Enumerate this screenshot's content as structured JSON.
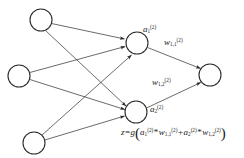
{
  "figure": {
    "type": "neural-network-diagram",
    "title": "",
    "background_color": "#ffffff",
    "stroke_color": "#2b2b2b",
    "text_color": "#1a1a1a"
  },
  "layers": [
    {
      "name": "input-layer",
      "nodes": [
        {
          "id": "input-1",
          "label": "",
          "cx": 41,
          "cy": 20,
          "r": 11
        },
        {
          "id": "input-2",
          "label": "",
          "cx": 19,
          "cy": 76,
          "r": 11
        },
        {
          "id": "input-3",
          "label": "",
          "cx": 34,
          "cy": 143,
          "r": 11
        }
      ]
    },
    {
      "name": "hidden-layer",
      "nodes": [
        {
          "id": "hidden-1",
          "label": "a",
          "sub": "1",
          "sup": "(2)",
          "cx": 137,
          "cy": 43,
          "r": 11
        },
        {
          "id": "hidden-2",
          "label": "a",
          "sub": "2",
          "sup": "(2)",
          "cx": 136,
          "cy": 112,
          "r": 11
        }
      ]
    },
    {
      "name": "output-layer",
      "nodes": [
        {
          "id": "output-1",
          "label": "",
          "cx": 210,
          "cy": 75,
          "r": 11
        }
      ]
    }
  ],
  "node_labels": {
    "a1": {
      "base": "a",
      "sub": "1",
      "sup": "(2)"
    },
    "a2": {
      "base": "a",
      "sub": "2",
      "sup": "(2)"
    }
  },
  "edge_labels": {
    "w11": {
      "base": "w",
      "sub": "1,1",
      "sup": "(2)"
    },
    "w12": {
      "base": "w",
      "sub": "1,2",
      "sup": "(2)"
    }
  },
  "edges": [
    {
      "from": "input-1",
      "to": "hidden-1",
      "label": ""
    },
    {
      "from": "input-1",
      "to": "hidden-2",
      "label": ""
    },
    {
      "from": "input-2",
      "to": "hidden-1",
      "label": ""
    },
    {
      "from": "input-2",
      "to": "hidden-2",
      "label": ""
    },
    {
      "from": "input-3",
      "to": "hidden-1",
      "label": ""
    },
    {
      "from": "input-3",
      "to": "hidden-2",
      "label": ""
    },
    {
      "from": "hidden-1",
      "to": "output-1",
      "label": "w_1,1^(2)"
    },
    {
      "from": "hidden-2",
      "to": "output-1",
      "label": "w_1,2^(2)"
    }
  ],
  "equation": {
    "text": "z = g (a₁⁽²⁾ * w₁,₁⁽²⁾ + a₂⁽²⁾ * w₁,₂⁽²⁾)",
    "parts": {
      "z": "z",
      "equals": "=",
      "g": "g",
      "open_paren": "(",
      "a1_base": "a",
      "a1_sub": "1",
      "a1_sup": "(2)",
      "times_1": "*",
      "w11_base": "w",
      "w11_sub": "1,1",
      "w11_sup": "(2)",
      "plus": "+",
      "a2_base": "a",
      "a2_sub": "2",
      "a2_sup": "(2)",
      "times_2": "*",
      "w12_base": "w",
      "w12_sub": "1,2",
      "w12_sup": "(2)",
      "close_paren": ")"
    }
  }
}
